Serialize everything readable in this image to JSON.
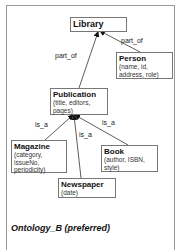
{
  "diagram": {
    "caption": "Ontology_B (preferred)",
    "nodes": {
      "library": {
        "title": "Library",
        "attrs": ""
      },
      "person": {
        "title": "Person",
        "attrs": "(name, id, address, role)"
      },
      "publication": {
        "title": "Publication",
        "attrs": "(title, editors, pages)"
      },
      "magazine": {
        "title": "Magazine",
        "attrs": "(category, issueNo, periodicity)"
      },
      "book": {
        "title": "Book",
        "attrs": "(author, ISBN, style)"
      },
      "newspaper": {
        "title": "Newspaper",
        "attrs": "(date)"
      }
    },
    "edges": [
      {
        "from": "Publication",
        "to": "Library",
        "label": "part_of"
      },
      {
        "from": "Person",
        "to": "Library",
        "label": "part_of"
      },
      {
        "from": "Magazine",
        "to": "Publication",
        "label": "is_a"
      },
      {
        "from": "Newspaper",
        "to": "Publication",
        "label": "is_a"
      },
      {
        "from": "Book",
        "to": "Publication",
        "label": "is_a"
      }
    ],
    "edge_labels": {
      "pub_library": "part_of",
      "person_library": "part_of",
      "mag_pub": "is_a",
      "news_pub": "is_a",
      "book_pub": "is_a"
    }
  }
}
